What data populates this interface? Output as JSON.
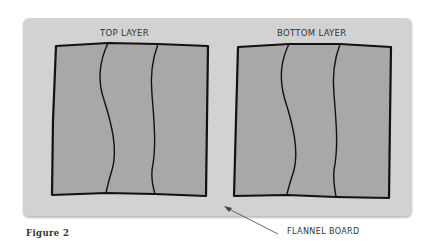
{
  "figure": {
    "caption": "Figure 2",
    "board_label": "FLANNEL BOARD",
    "panels": [
      {
        "title": "TOP LAYER"
      },
      {
        "title": "BOTTOM LAYER"
      }
    ]
  },
  "colors": {
    "board": "#d2d2d2",
    "panel_fill": "#a8a8a8",
    "outline": "#111111"
  }
}
